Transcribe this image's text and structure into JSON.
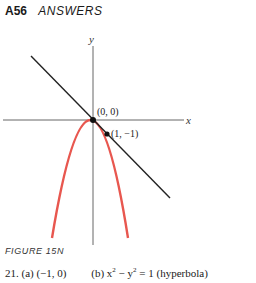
{
  "header": {
    "page_number": "A56",
    "section": "ANSWERS"
  },
  "figure": {
    "axis_labels": {
      "x": "x",
      "y": "y"
    },
    "points": [
      {
        "label": "(0, 0)",
        "x": 0,
        "y": 0
      },
      {
        "label": "(1, −1)",
        "x": 1,
        "y": -1
      }
    ],
    "curves": [
      {
        "name": "parabola",
        "color": "#e8574f"
      },
      {
        "name": "tangent-line",
        "color": "#222222"
      }
    ],
    "caption": "FIGURE  15N"
  },
  "answer_line": {
    "number": "21.",
    "part_a": "(a) (−1, 0)",
    "part_b_prefix": "(b) x",
    "part_b_mid": " − y",
    "part_b_suffix": " = 1 (hyperbola)",
    "exponent": "2"
  }
}
